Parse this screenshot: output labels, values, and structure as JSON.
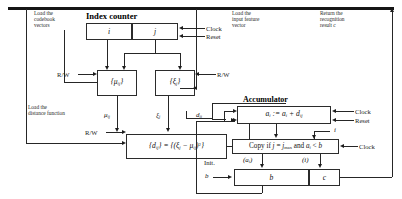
{
  "diagram": {
    "title": "Index counter",
    "accumulator_title": "Accumulator",
    "annotations": {
      "load_codebook": "Load the\ncodebook\nvectors",
      "load_input_feature": "Load the\ninput feature\nvector",
      "return_result": "Return the\nrecognition\nresult c",
      "load_distance": "Load the\ndistance function"
    },
    "signals": {
      "clock": "Clock",
      "reset": "Reset",
      "clock2": "Clock",
      "reset2": "Reset",
      "clock3": "Clock",
      "rw_left_top": "R/W",
      "rw_right_top": "R/W",
      "rw_left_bottom": "R/W",
      "init": "Init.",
      "init_var": "b"
    },
    "blocks": {
      "counter_i": "i",
      "counter_j": "j",
      "mu_store": "{μ",
      "mu_sub": "ij",
      "mu_close": "}",
      "xi_store": "{ξ",
      "xi_sub": "j",
      "xi_close": "}",
      "distance_formula_plain": "{d ij} = {(ξ j - μ ij)2}",
      "accumulator_formula_plain": "a i := a i + d ij",
      "copy_condition_plain": "Copy if j = j max and a i < b",
      "register_b": "b",
      "register_c": "c"
    },
    "wire_labels": {
      "mu_out": "μ",
      "mu_out_sub": "ij",
      "xi_out": "ξ",
      "xi_out_sub": "j",
      "d_out": "d",
      "d_out_sub": "ij",
      "i_feed": "i",
      "ai_paren": "(a",
      "ai_paren_sub": "i",
      "ai_paren_close": ")",
      "i_paren": "(i)",
      "d_left": "ij"
    }
  }
}
